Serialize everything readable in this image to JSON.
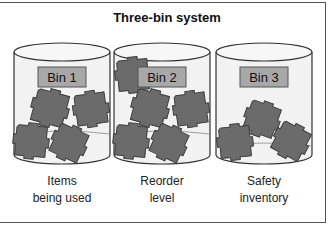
{
  "title": "Three-bin system",
  "colors": {
    "bin_fill": "#f2f2f2",
    "bin_stroke": "#333333",
    "label_fill": "#a8a8a8",
    "item_fill": "#6b6b6b",
    "item_stroke": "#3a3a3a"
  },
  "bins": [
    {
      "label": "Bin 1",
      "caption_line1": "Items",
      "caption_line2": "being used"
    },
    {
      "label": "Bin 2",
      "caption_line1": "Reorder",
      "caption_line2": "level"
    },
    {
      "label": "Bin 3",
      "caption_line1": "Safety",
      "caption_line2": "inventory"
    }
  ]
}
